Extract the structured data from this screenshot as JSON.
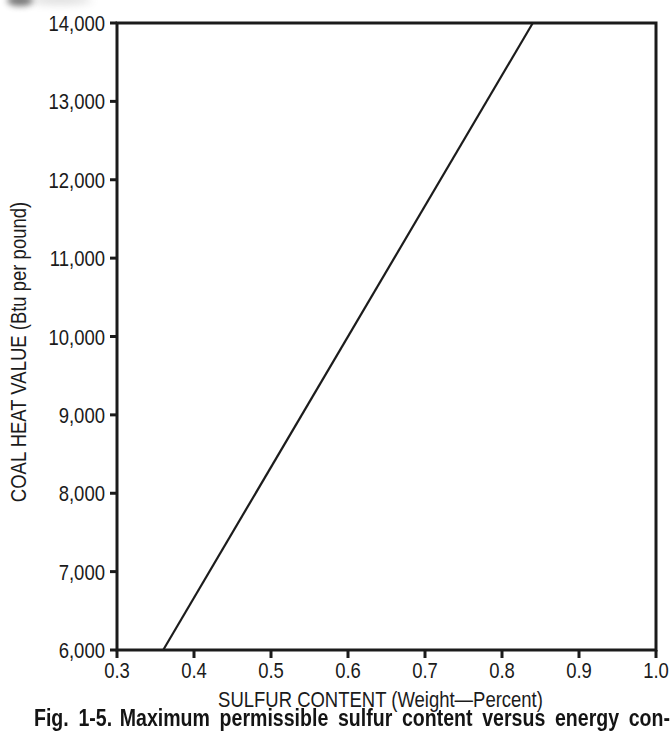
{
  "figure": {
    "caption": {
      "label": "Fig. 1-5.",
      "text": "Maximum permissible sulfur content versus energy con-"
    }
  },
  "chart_data": {
    "type": "line",
    "title": "",
    "xlabel": "SULFUR CONTENT (Weight—Percent)",
    "ylabel": "COAL HEAT VALUE (Btu per pound)",
    "xlim": [
      0.3,
      1.0
    ],
    "ylim": [
      6000,
      14000
    ],
    "grid": false,
    "legend": false,
    "background": "#ffffff",
    "axis_color": "#1b1b1b",
    "x_ticks": {
      "values": [
        0.3,
        0.4,
        0.5,
        0.6,
        0.7,
        0.8,
        0.9,
        1.0
      ],
      "labels": [
        "0.3",
        "0.4",
        "0.5",
        "0.6",
        "0.7",
        "0.8",
        "0.9",
        "1.0"
      ]
    },
    "y_ticks": {
      "values": [
        6000,
        7000,
        8000,
        9000,
        10000,
        11000,
        12000,
        13000,
        14000
      ],
      "labels": [
        "6,000",
        "7,000",
        "8,000",
        "9,000",
        "10,000",
        "11,000",
        "12,000",
        "13,000",
        "14,000"
      ]
    },
    "series": [
      {
        "name": "maximum permissible sulfur content line",
        "color": "#1c1c1c",
        "points": [
          [
            0.36,
            6000
          ],
          [
            0.84,
            14000
          ]
        ]
      }
    ]
  }
}
